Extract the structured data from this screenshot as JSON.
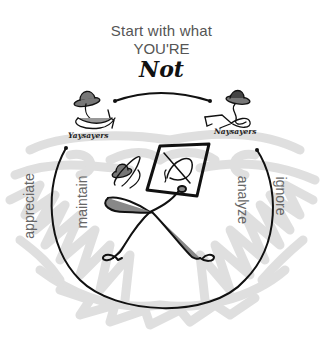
{
  "title": {
    "line1": "Start with what",
    "line2": "YOU'RE",
    "line3": "Not"
  },
  "figures": {
    "left_caption": "Yaysayers",
    "right_caption": "Naysayers"
  },
  "labels": {
    "outer_left": "appreciate",
    "inner_left": "maintain",
    "inner_right": "analyze",
    "outer_right": "ignore"
  },
  "colors": {
    "scribble": "#d9d9d9",
    "line": "#111111",
    "text": "#555555"
  }
}
